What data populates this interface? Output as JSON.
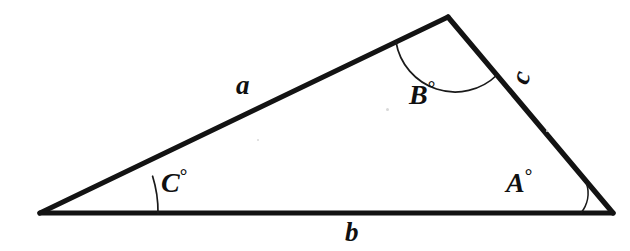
{
  "figure": {
    "kind": "triangle-diagram",
    "background_color": "#ffffff",
    "stroke_color": "#131313",
    "arc_color": "#1a1a1a",
    "width": 630,
    "height": 251,
    "vertices": {
      "left": {
        "name": "left-vertex",
        "x": 40,
        "y": 213
      },
      "apex": {
        "name": "apex-vertex",
        "x": 448,
        "y": 17
      },
      "right": {
        "name": "right-vertex",
        "x": 613,
        "y": 213
      }
    },
    "sides": [
      {
        "id": "a",
        "label": "a",
        "from": "left",
        "to": "apex",
        "position": "upper-left"
      },
      {
        "id": "b",
        "label": "b",
        "from": "left",
        "to": "right",
        "position": "bottom"
      },
      {
        "id": "c",
        "label": "c",
        "from": "apex",
        "to": "right",
        "position": "right",
        "rotated": true
      }
    ],
    "angles": [
      {
        "id": "A",
        "label": "A",
        "degree_symbol": "°",
        "at": "right",
        "arc_radius": 32
      },
      {
        "id": "B",
        "label": "B",
        "degree_symbol": "°",
        "at": "apex",
        "arc_radius": 60
      },
      {
        "id": "C",
        "label": "C",
        "degree_symbol": "°",
        "at": "left",
        "arc_radius": 118
      }
    ]
  }
}
